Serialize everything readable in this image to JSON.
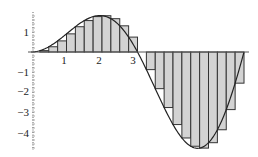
{
  "chart_data": {
    "type": "bar",
    "subtype": "riemann-sum-with-curve",
    "title": "",
    "xlabel": "",
    "ylabel": "",
    "function": "x*sin(x)",
    "interval": [
      0,
      6.2832
    ],
    "n_subintervals": 24,
    "rule": "left-endpoint",
    "bar_width": 0.2618,
    "x": [
      0,
      0.2618,
      0.5236,
      0.7854,
      1.0472,
      1.309,
      1.5708,
      1.8326,
      2.0944,
      2.3562,
      2.618,
      2.8798,
      3.1416,
      3.4034,
      3.6652,
      3.927,
      4.1888,
      4.4506,
      4.7124,
      4.9742,
      5.236,
      5.4978,
      5.7596,
      6.0214
    ],
    "values": [
      0,
      0.068,
      0.262,
      0.555,
      0.907,
      1.264,
      1.571,
      1.77,
      1.814,
      1.666,
      1.309,
      0.745,
      0,
      -0.881,
      -1.833,
      -2.777,
      -3.628,
      -4.299,
      -4.712,
      -4.805,
      -4.535,
      -3.888,
      -2.88,
      -1.558
    ],
    "x_ticks": [
      1,
      2,
      3
    ],
    "x_tick_labels": [
      "1",
      "2",
      "3"
    ],
    "y_ticks": [
      1,
      -1,
      -2,
      -3,
      -4
    ],
    "y_tick_labels": [
      "1",
      "−1",
      "−2",
      "−3",
      "−4"
    ],
    "xlim": [
      -0.1,
      6.4
    ],
    "ylim": [
      -4.85,
      1.95
    ],
    "grid": false,
    "legend": null,
    "colors": {
      "bar_fill": "#d3d3d3",
      "bar_stroke": "#333333",
      "curve": "#222222",
      "axis": "#555555"
    }
  }
}
